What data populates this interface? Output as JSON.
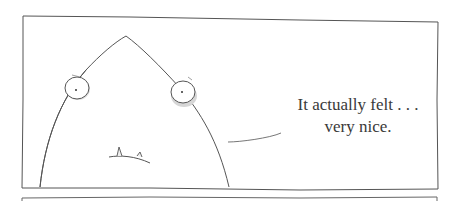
{
  "comic": {
    "panel_count_visible": 2,
    "caption": {
      "line1": "It actually felt . . .",
      "line2": "very nice."
    },
    "colors": {
      "ink": "#4a4a4a",
      "shade": "#c8c8c8",
      "background": "#ffffff"
    }
  }
}
